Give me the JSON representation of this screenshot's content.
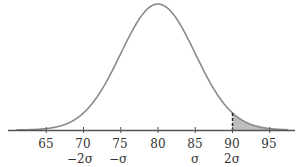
{
  "chart_data": {
    "type": "area",
    "title": "",
    "mean": 80,
    "sd": 5,
    "xlim": [
      60,
      97
    ],
    "x_ticks": [
      65,
      70,
      75,
      80,
      85,
      90,
      95
    ],
    "sigma_labels": [
      {
        "x": 70,
        "label": "−2σ"
      },
      {
        "x": 75,
        "label": "−σ"
      },
      {
        "x": 85,
        "label": "σ"
      },
      {
        "x": 90,
        "label": "2σ"
      }
    ],
    "shaded_region": {
      "from": 90,
      "to": 97
    },
    "dashed_line_at": 90,
    "grid": false,
    "colors": {
      "curve": "#888888",
      "shade": "#bbbbbb",
      "axis": "#555555"
    }
  },
  "labels": {
    "t65": "65",
    "t70": "70",
    "t75": "75",
    "t80": "80",
    "t85": "85",
    "t90": "90",
    "t95": "95",
    "s_m2": "−2σ",
    "s_m1": "−σ",
    "s_p1": "σ",
    "s_p2": "2σ"
  }
}
